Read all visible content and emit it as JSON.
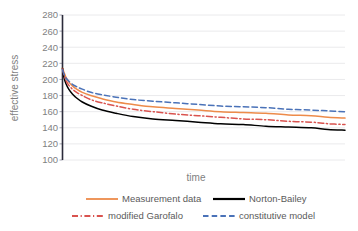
{
  "chart_data": {
    "type": "line",
    "title": "",
    "xlabel": "time",
    "ylabel": "effective stress",
    "grid": "horizontal-faint",
    "legend_position": "bottom",
    "ylim": [
      100,
      280
    ],
    "yticks": [
      100,
      120,
      140,
      160,
      180,
      200,
      220,
      240,
      260,
      280
    ],
    "ytick_labels": [
      "100",
      "120",
      "140",
      "160",
      "180",
      "200",
      "220",
      "240",
      "260",
      "280"
    ],
    "xlim": [
      0,
      1
    ],
    "xticks": [],
    "xtick_labels": [],
    "x": [
      0,
      0.005,
      0.012,
      0.022,
      0.035,
      0.05,
      0.07,
      0.1,
      0.14,
      0.19,
      0.25,
      0.32,
      0.4,
      0.48,
      0.56,
      0.64,
      0.72,
      0.8,
      0.88,
      0.94,
      1.0
    ],
    "series": [
      {
        "name": "Measurement data",
        "color": "#ed8b4a",
        "style": "solid",
        "values": [
          214,
          209,
          203,
          197,
          192,
          188,
          184,
          180,
          176,
          172,
          169,
          166,
          164,
          162,
          160,
          159,
          158,
          156,
          155,
          153,
          152
        ]
      },
      {
        "name": "Norton-Bailey",
        "color": "#000000",
        "style": "solid",
        "values": [
          214,
          203,
          195,
          188,
          182,
          177,
          172,
          167,
          162,
          158,
          154,
          151,
          149,
          147,
          145,
          144,
          142,
          141,
          140,
          138,
          137
        ]
      },
      {
        "name": "modified Garofalo",
        "color": "#d9534f",
        "style": "dash-dot",
        "values": [
          213,
          206,
          199,
          193,
          188,
          184,
          180,
          175,
          171,
          167,
          163,
          160,
          157,
          155,
          153,
          151,
          150,
          148,
          147,
          145,
          144
        ]
      },
      {
        "name": "constitutive model",
        "color": "#4a72b8",
        "style": "dashed",
        "values": [
          212,
          207,
          202,
          198,
          194,
          191,
          188,
          184,
          181,
          178,
          175,
          173,
          171,
          169,
          167,
          166,
          165,
          163,
          162,
          161,
          160
        ]
      }
    ],
    "annotations": []
  },
  "axis": {
    "y_title": "effective stress",
    "x_title": "time"
  },
  "legend": {
    "items": [
      {
        "label": "Measurement data",
        "color": "#ed8b4a",
        "style": "solid"
      },
      {
        "label": "Norton-Bailey",
        "color": "#000000",
        "style": "solid"
      },
      {
        "label": "modified Garofalo",
        "color": "#d9534f",
        "style": "dash-dot"
      },
      {
        "label": "constitutive model",
        "color": "#4a72b8",
        "style": "dashed"
      }
    ]
  },
  "colors": {
    "measurement": "#ed8b4a",
    "norton_bailey": "#000000",
    "garofalo": "#d9534f",
    "constitutive": "#4a72b8",
    "axis_text": "#7f7f7f",
    "grid": "#e8e8ea",
    "axis_line": "#2b2b3a"
  }
}
